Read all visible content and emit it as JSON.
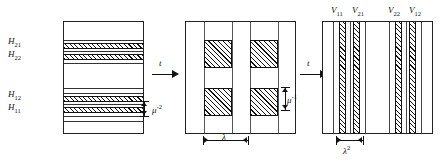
{
  "figure": {
    "type": "technical-diagram"
  },
  "panel1": {
    "name": "horizontal-layers-panel",
    "labels": [
      {
        "id": "H21",
        "base": "H",
        "sub": "21"
      },
      {
        "id": "H22",
        "base": "H",
        "sub": "22"
      },
      {
        "id": "H12",
        "base": "H",
        "sub": "12"
      },
      {
        "id": "H11",
        "base": "H",
        "sub": "11"
      }
    ],
    "dimension": {
      "base": "μ",
      "sup": "-2"
    }
  },
  "panel2": {
    "name": "square-grid-panel",
    "dimension_horizontal": {
      "base": "λ",
      "sup": ""
    },
    "dimension_vertical": {
      "base": "μ",
      "sup": "-1"
    }
  },
  "panel3": {
    "name": "vertical-stripes-panel",
    "labels": [
      {
        "id": "V11",
        "base": "V",
        "sub": "11"
      },
      {
        "id": "V21",
        "base": "V",
        "sub": "21"
      },
      {
        "id": "V22",
        "base": "V",
        "sub": "22"
      },
      {
        "id": "V12",
        "base": "V",
        "sub": "12"
      }
    ],
    "dimension": {
      "base": "λ",
      "sup": "2"
    }
  },
  "arrows": {
    "arrow1_label": "t",
    "arrow2_label": "t"
  },
  "colors": {
    "ink": "#111111",
    "rule": "#333333",
    "background": "#ffffff"
  }
}
